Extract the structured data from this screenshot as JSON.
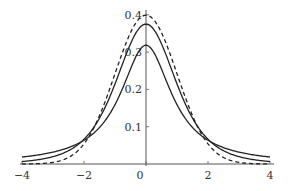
{
  "chart_data": {
    "type": "line",
    "title": "",
    "xlabel": "",
    "ylabel": "",
    "xlim": [
      -4,
      4
    ],
    "ylim": [
      0,
      0.41
    ],
    "grid": false,
    "legend": "none",
    "x_ticks": [
      "-4",
      "-2",
      "0",
      "2",
      "4"
    ],
    "x_tick_values": [
      -4,
      -2,
      0,
      2,
      4
    ],
    "y_ticks": [
      "0.1",
      "0.2",
      "0.3",
      "0.4"
    ],
    "y_tick_values": [
      0.1,
      0.2,
      0.3,
      0.4
    ],
    "x": [
      -4,
      -3.5,
      -3,
      -2.5,
      -2,
      -1.5,
      -1,
      -0.5,
      0,
      0.5,
      1,
      1.5,
      2,
      2.5,
      3,
      3.5,
      4
    ],
    "series": [
      {
        "name": "normal (dashed)",
        "style": "dashed",
        "values": [
          0.0001,
          0.0009,
          0.0044,
          0.0175,
          0.054,
          0.1295,
          0.242,
          0.3521,
          0.3989,
          0.3521,
          0.242,
          0.1295,
          0.054,
          0.0175,
          0.0044,
          0.0009,
          0.0001
        ]
      },
      {
        "name": "t (nu=4)",
        "style": "solid",
        "values": [
          0.0066,
          0.0112,
          0.0197,
          0.0353,
          0.0663,
          0.1244,
          0.2147,
          0.3222,
          0.375,
          0.3222,
          0.2147,
          0.1244,
          0.0663,
          0.0353,
          0.0197,
          0.0112,
          0.0066
        ]
      },
      {
        "name": "t (nu=1, Cauchy)",
        "style": "solid",
        "values": [
          0.0187,
          0.0241,
          0.0318,
          0.0439,
          0.0637,
          0.0979,
          0.1592,
          0.2546,
          0.3183,
          0.2546,
          0.1592,
          0.0979,
          0.0637,
          0.0439,
          0.0318,
          0.0241,
          0.0187
        ]
      }
    ]
  }
}
